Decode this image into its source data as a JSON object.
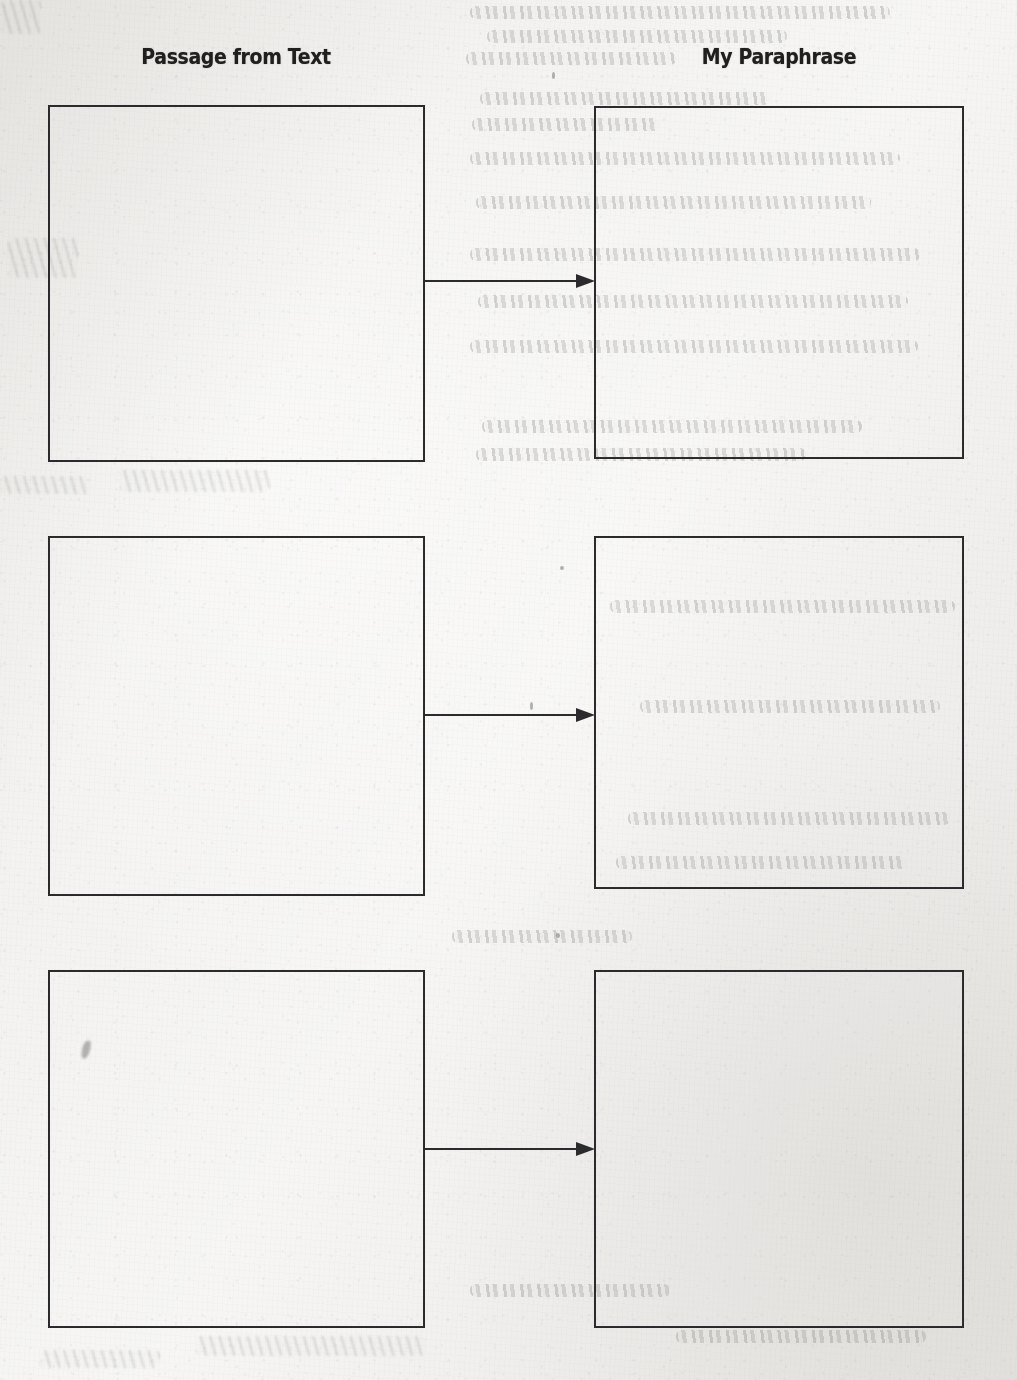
{
  "worksheet": {
    "background_color": "#f3f2f0",
    "ink_color": "#29292b",
    "columns": [
      {
        "id": "passage",
        "header": "Passage from Text"
      },
      {
        "id": "paraphrase",
        "header": "My Paraphrase"
      }
    ],
    "rows": [
      {
        "row_number": "1",
        "left_box": {
          "placeholder": "",
          "value": ""
        },
        "right_box": {
          "placeholder": "",
          "value": ""
        },
        "connector": "arrow-right"
      },
      {
        "row_number": "2",
        "left_box": {
          "placeholder": "",
          "value": ""
        },
        "right_box": {
          "placeholder": "",
          "value": ""
        },
        "connector": "arrow-right"
      },
      {
        "row_number": "3",
        "left_box": {
          "placeholder": "",
          "value": ""
        },
        "right_box": {
          "placeholder": "",
          "value": ""
        },
        "connector": "arrow-right"
      }
    ],
    "artifacts": {
      "bleed_through_note": "faint illegible handwriting showing through from reverse side of page",
      "ink_smudge_note": "small ink blemish inside row 3 left box"
    }
  }
}
